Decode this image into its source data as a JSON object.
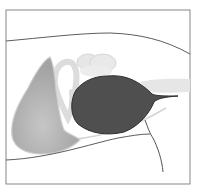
{
  "diagram": {
    "type": "anatomical-illustration",
    "style": "grayscale sagittal cross-section",
    "labels": [],
    "colors": {
      "background": "#ffffff",
      "frame": "#7a7a7a",
      "contour_line": "#4a4a4a",
      "dark_organ": "#4f4f4f",
      "dark_organ_outline": "#2e2e2e",
      "left_organ": "#a9a9a9",
      "left_organ_highlight": "#c4c4c4",
      "pale_structures": "#e3e3e3",
      "pale_outline": "#d0d0d0",
      "right_tube": "#e6e6e6",
      "light_curve": "#d4d4d4"
    },
    "elements": [
      {
        "name": "frame",
        "description": "rectangular border around illustration"
      },
      {
        "name": "upper-body-contour",
        "description": "curved line across upper part"
      },
      {
        "name": "lower-body-contour",
        "description": "curved line across lower part"
      },
      {
        "name": "left-organ",
        "description": "medium gray teardrop shape on left"
      },
      {
        "name": "looped-tube",
        "description": "pale outlined loop structure"
      },
      {
        "name": "pale-ovals",
        "description": "pale rounded structures at top center"
      },
      {
        "name": "dark-organ",
        "description": "large dark oval with tapering tail to the right"
      },
      {
        "name": "right-tube",
        "description": "pale horizontal band on right"
      },
      {
        "name": "descending-line",
        "description": "thin dark line descending on lower right"
      }
    ]
  }
}
